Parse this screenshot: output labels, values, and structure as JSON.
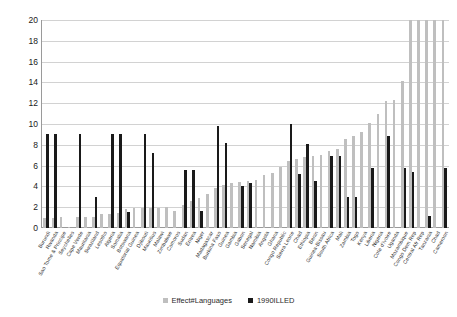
{
  "chart_data": {
    "type": "bar",
    "title": "",
    "subtitle": "",
    "xlabel": "",
    "ylabel": "",
    "ylim": [
      0,
      20
    ],
    "ytick_step": 2,
    "yticks": [
      0,
      2,
      4,
      6,
      8,
      10,
      12,
      14,
      16,
      18,
      20
    ],
    "grid": true,
    "legend_position": "bottom",
    "categories": [
      "Burundi",
      "Rwanda",
      "Sao Tome & Principe",
      "Seychelles",
      "Cape Verde",
      "Mauritania",
      "Swaziland",
      "Lesotho",
      "Algeria",
      "Somalia",
      "Botswana",
      "Equatorial Guinea",
      "Djibouti",
      "Mauritius",
      "Malawi",
      "Zimbabwe",
      "Comoros",
      "Sudan",
      "Eritrea",
      "Niger",
      "Madagascar",
      "Burkina Faso",
      "Guinea",
      "Gambia",
      "Gabon",
      "Senegal",
      "Namibia",
      "Angola",
      "Ghana",
      "Congo Republic",
      "Sierra Leone",
      "Chad",
      "Ethiopia",
      "Benin",
      "Guinea-Bissau",
      "South Africa",
      "Mali",
      "Zambia",
      "Togo",
      "Kenya",
      "Liberia",
      "Nigeria",
      "Cote d'Ivoire",
      "Uganda",
      "Mozambique",
      "Congo Dem Rep",
      "Central Afr Rep",
      "Tanzania",
      "Chad",
      "Cameroon"
    ],
    "series": [
      {
        "name": "Effect#Languages",
        "color": "#bfbfbf",
        "values": [
          1.0,
          1.0,
          1.1,
          0.1,
          1.1,
          1.1,
          1.1,
          1.3,
          1.3,
          1.4,
          1.8,
          1.9,
          1.9,
          1.9,
          1.9,
          2.0,
          1.6,
          2.2,
          2.6,
          2.9,
          3.3,
          3.8,
          4.1,
          4.3,
          4.4,
          4.5,
          4.6,
          5.1,
          5.3,
          5.9,
          6.4,
          6.6,
          6.8,
          6.9,
          7.0,
          7.4,
          7.6,
          8.6,
          8.8,
          9.2,
          10.1,
          11.0,
          12.2,
          12.3,
          14.1,
          20.0,
          20.0,
          20.0,
          20.0,
          20.0
        ]
      },
      {
        "name": "1990ILLED",
        "color": "#1a1a1a",
        "values": [
          9.0,
          9.0,
          0.0,
          0.0,
          9.0,
          0.0,
          3.0,
          0.0,
          9.0,
          9.0,
          1.5,
          0.0,
          9.0,
          7.2,
          0.0,
          0.0,
          0.0,
          5.6,
          5.6,
          1.6,
          0.0,
          9.8,
          8.2,
          0.0,
          4.0,
          4.3,
          0.0,
          0.0,
          0.0,
          0.0,
          10.0,
          5.2,
          8.1,
          4.5,
          0.0,
          6.9,
          6.9,
          3.0,
          3.0,
          0.0,
          5.8,
          0.0,
          8.8,
          0.0,
          5.8,
          5.4,
          0.0,
          1.2,
          0.0,
          5.8
        ]
      }
    ]
  },
  "legend": {
    "items": [
      {
        "label": "Effect#Languages"
      },
      {
        "label": "1990ILLED"
      }
    ]
  },
  "colors": {
    "series_a": "#bfbfbf",
    "series_b": "#1a1a1a",
    "grid": "#d2d2d2",
    "axis": "#9a9a9a",
    "text": "#1a1a1a",
    "background": "#ffffff"
  }
}
